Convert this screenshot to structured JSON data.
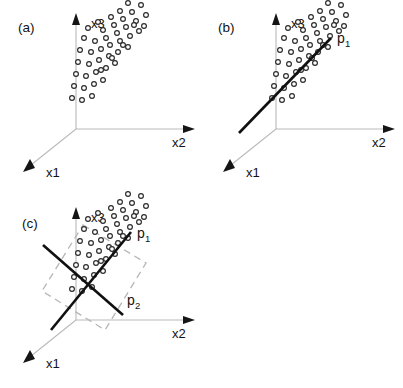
{
  "figure": {
    "caption_panels": [
      "(a)",
      "(b)",
      "(c)"
    ],
    "background_color": "#ffffff",
    "axis_color": "#b9b9b9",
    "point_stroke_color": "#2a2a2a",
    "pc_line_color": "#101010",
    "plane_color": "#b6b6b6"
  },
  "panels": [
    {
      "id": "a",
      "label": "(a)",
      "label_x": 18,
      "label_y": 32,
      "origin": {
        "x": 76,
        "y": 129
      },
      "axes": [
        {
          "name": "x3",
          "label": "x3",
          "label_x": 91,
          "label_y": 28,
          "x1": 76,
          "y1": 129,
          "x2": 76,
          "y2": 22,
          "head": "76,13 72,25 80,25"
        },
        {
          "name": "x2",
          "label": "x2",
          "label_x": 172,
          "label_y": 147,
          "x1": 76,
          "y1": 129,
          "x2": 186,
          "y2": 129,
          "head": "195,129 183,125 183,133"
        },
        {
          "name": "x1",
          "label": "x1",
          "label_x": 46,
          "label_y": 177,
          "x1": 76,
          "y1": 129,
          "x2": 31,
          "y2": 165,
          "head": "23,172 35,168 30,159"
        }
      ],
      "pc_lines": [],
      "plane": null
    },
    {
      "id": "b",
      "label": "(b)",
      "label_x": 218,
      "label_y": 32,
      "origin": {
        "x": 276,
        "y": 129
      },
      "axes": [
        {
          "name": "x3",
          "label": "x3",
          "label_x": 291,
          "label_y": 28,
          "x1": 276,
          "y1": 129,
          "x2": 276,
          "y2": 22,
          "head": "276,13 272,25 280,25"
        },
        {
          "name": "x2",
          "label": "x2",
          "label_x": 372,
          "label_y": 147,
          "x1": 276,
          "y1": 129,
          "x2": 386,
          "y2": 129,
          "head": "395,129 383,125 383,133"
        },
        {
          "name": "x1",
          "label": "x1",
          "label_x": 246,
          "label_y": 177,
          "x1": 276,
          "y1": 129,
          "x2": 231,
          "y2": 165,
          "head": "223,172 235,168 230,159"
        }
      ],
      "pc_lines": [
        {
          "name": "p1",
          "label": "p",
          "subscript": "1",
          "label_x": 337,
          "label_y": 43,
          "sub_x": 345,
          "sub_y": 47,
          "x1": 239,
          "y1": 133,
          "x2": 331,
          "y2": 38
        }
      ],
      "plane": null
    },
    {
      "id": "c",
      "label": "(c)",
      "label_x": 22,
      "label_y": 228,
      "origin": {
        "x": 76,
        "y": 320
      },
      "axes": [
        {
          "name": "x3",
          "label": "x3",
          "label_x": 91,
          "label_y": 222,
          "x1": 76,
          "y1": 320,
          "x2": 76,
          "y2": 216,
          "head": "76,207 72,219 80,219"
        },
        {
          "name": "x2",
          "label": "x2",
          "label_x": 172,
          "label_y": 338,
          "x1": 76,
          "y1": 320,
          "x2": 186,
          "y2": 320,
          "head": "195,320 183,316 183,324"
        },
        {
          "name": "x1",
          "label": "x1",
          "label_x": 46,
          "label_y": 368,
          "x1": 76,
          "y1": 320,
          "x2": 31,
          "y2": 356,
          "head": "23,363 35,359 30,350"
        }
      ],
      "pc_lines": [
        {
          "name": "p1",
          "label": "p",
          "subscript": "1",
          "label_x": 137,
          "label_y": 238,
          "sub_x": 145,
          "sub_y": 242,
          "x1": 51,
          "y1": 330,
          "x2": 131,
          "y2": 232
        },
        {
          "name": "p2",
          "label": "p",
          "subscript": "2",
          "label_x": 127,
          "label_y": 305,
          "sub_x": 135,
          "sub_y": 309,
          "x1": 43,
          "y1": 245,
          "x2": 123,
          "y2": 315
        }
      ],
      "plane": {
        "name": "principal-plane",
        "points": "83,225 146,263 105,330 42,291"
      }
    }
  ],
  "scatter": {
    "description": "elongated point cloud of open circles",
    "radius": 2.4,
    "points": [
      [
        22,
        8
      ],
      [
        35,
        3
      ],
      [
        44,
        -3
      ],
      [
        52,
        -11
      ],
      [
        12,
        14
      ],
      [
        27,
        16
      ],
      [
        38,
        11
      ],
      [
        47,
        5
      ],
      [
        56,
        -2
      ],
      [
        65,
        -9
      ],
      [
        8,
        24
      ],
      [
        19,
        27
      ],
      [
        30,
        24
      ],
      [
        41,
        19
      ],
      [
        50,
        13
      ],
      [
        60,
        7
      ],
      [
        70,
        1
      ],
      [
        4,
        36
      ],
      [
        15,
        38
      ],
      [
        25,
        35
      ],
      [
        34,
        31
      ],
      [
        44,
        27
      ],
      [
        54,
        22
      ],
      [
        63,
        17
      ],
      [
        2,
        48
      ],
      [
        13,
        50
      ],
      [
        23,
        46
      ],
      [
        33,
        42
      ],
      [
        42,
        38
      ],
      [
        52,
        33
      ],
      [
        0,
        60
      ],
      [
        10,
        62
      ],
      [
        20,
        58
      ],
      [
        30,
        54
      ],
      [
        39,
        49
      ],
      [
        -2,
        72
      ],
      [
        8,
        74
      ],
      [
        18,
        70
      ],
      [
        27,
        66
      ],
      [
        -4,
        84
      ],
      [
        6,
        86
      ],
      [
        16,
        82
      ],
      [
        58,
        11
      ],
      [
        68,
        12
      ],
      [
        47,
        31
      ],
      [
        36,
        44
      ],
      [
        25,
        56
      ]
    ]
  },
  "chart_data": {
    "type": "scatter",
    "panels": [
      "(a) data cloud in 3D",
      "(b) first principal component p1",
      "(c) first and second principal components p1, p2 spanning a plane"
    ],
    "xlabel": "x2",
    "ylabel": "x3",
    "zlabel": "x1",
    "axis_names": [
      "x1",
      "x2",
      "x3"
    ],
    "component_names": [
      "p1",
      "p2"
    ],
    "grid": false,
    "legend": "none"
  }
}
